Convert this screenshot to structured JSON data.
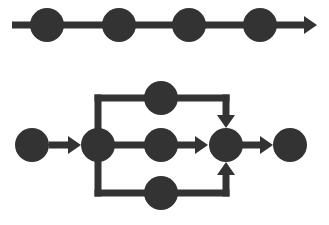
{
  "canvas": {
    "width": 329,
    "height": 225,
    "background_color": "#ffffff",
    "ink_color": "#333333"
  },
  "style": {
    "node_radius": 17,
    "edge_thickness": 7,
    "arrowhead_length": 13,
    "arrowhead_half_width": 9
  },
  "diagrams": [
    {
      "id": "sequential-pipeline",
      "name": "Sequential pipeline",
      "type": "linear-chain",
      "node_count": 4,
      "nodes": [
        {
          "id": "seq-node-1",
          "label": "",
          "cx": 47,
          "cy": 25,
          "r": 17
        },
        {
          "id": "seq-node-2",
          "label": "",
          "cx": 119,
          "cy": 25,
          "r": 17
        },
        {
          "id": "seq-node-3",
          "label": "",
          "cx": 189,
          "cy": 25,
          "r": 17
        },
        {
          "id": "seq-node-4",
          "label": "",
          "cx": 260,
          "cy": 25,
          "r": 17
        }
      ],
      "edges": [
        {
          "id": "seq-edge-main",
          "from": "start",
          "to": "seq-arrow-end",
          "x1": 12,
          "y1": 25,
          "x2": 304,
          "y2": 25,
          "arrow": "end"
        }
      ],
      "arrowheads": [
        {
          "id": "seq-arrowhead",
          "tip_x": 317,
          "tip_y": 25,
          "direction": "right"
        }
      ]
    },
    {
      "id": "fork-join-pipeline",
      "name": "Fork join pipeline",
      "type": "branching",
      "node_count": 7,
      "branch_count": 3,
      "nodes": [
        {
          "id": "fj-start",
          "role": "start",
          "label": "",
          "cx": 32,
          "cy": 145,
          "r": 17
        },
        {
          "id": "fj-split",
          "role": "split",
          "label": "",
          "cx": 98,
          "cy": 145,
          "r": 17
        },
        {
          "id": "fj-branch-top",
          "role": "task",
          "label": "",
          "cx": 161,
          "cy": 98,
          "r": 17
        },
        {
          "id": "fj-branch-mid",
          "role": "task",
          "label": "",
          "cx": 161,
          "cy": 145,
          "r": 17
        },
        {
          "id": "fj-branch-bot",
          "role": "task",
          "label": "",
          "cx": 161,
          "cy": 193,
          "r": 17
        },
        {
          "id": "fj-merge",
          "role": "merge",
          "label": "",
          "cx": 226,
          "cy": 145,
          "r": 17
        },
        {
          "id": "fj-end",
          "role": "end",
          "label": "",
          "cx": 290,
          "cy": 145,
          "r": 17
        }
      ],
      "edges": [
        {
          "id": "fj-edge-start-split",
          "from": "fj-start",
          "to": "fj-split",
          "kind": "straight-right",
          "x1": 49,
          "y1": 145,
          "x2": 68,
          "y2": 145,
          "arrow": "end",
          "tip_x": 81,
          "tip_y": 145
        },
        {
          "id": "fj-edge-split-up",
          "from": "fj-split",
          "to": "fj-branch-top",
          "kind": "rail-up",
          "x1": 98,
          "y1": 145,
          "x2": 98,
          "y2": 98,
          "arrow": "none"
        },
        {
          "id": "fj-edge-top-rail",
          "from": "fj-split",
          "to": "fj-merge",
          "kind": "rail-horizontal-top",
          "x1": 98,
          "y1": 98,
          "x2": 226,
          "y2": 98,
          "arrow": "none"
        },
        {
          "id": "fj-edge-top-down",
          "from": "fj-branch-top",
          "to": "fj-merge",
          "kind": "rail-down",
          "x1": 226,
          "y1": 98,
          "x2": 226,
          "y2": 115,
          "arrow": "end",
          "tip_x": 226,
          "tip_y": 128,
          "direction": "down"
        },
        {
          "id": "fj-edge-split-mid",
          "from": "fj-split",
          "to": "fj-branch-mid",
          "kind": "straight-right",
          "x1": 112,
          "y1": 145,
          "x2": 147,
          "y2": 145,
          "arrow": "none"
        },
        {
          "id": "fj-edge-mid-merge",
          "from": "fj-branch-mid",
          "to": "fj-merge",
          "kind": "straight-right",
          "x1": 175,
          "y1": 145,
          "x2": 195,
          "y2": 145,
          "arrow": "end",
          "tip_x": 208,
          "tip_y": 145
        },
        {
          "id": "fj-edge-split-down",
          "from": "fj-split",
          "to": "fj-branch-bot",
          "kind": "rail-down",
          "x1": 98,
          "y1": 145,
          "x2": 98,
          "y2": 193,
          "arrow": "none"
        },
        {
          "id": "fj-edge-bot-rail",
          "from": "fj-split",
          "to": "fj-merge",
          "kind": "rail-horizontal-bottom",
          "x1": 98,
          "y1": 193,
          "x2": 226,
          "y2": 193,
          "arrow": "none"
        },
        {
          "id": "fj-edge-bot-up",
          "from": "fj-branch-bot",
          "to": "fj-merge",
          "kind": "rail-up",
          "x1": 226,
          "y1": 193,
          "x2": 226,
          "y2": 175,
          "arrow": "end",
          "tip_x": 226,
          "tip_y": 162,
          "direction": "up"
        },
        {
          "id": "fj-edge-merge-end",
          "from": "fj-merge",
          "to": "fj-end",
          "kind": "straight-right",
          "x1": 242,
          "y1": 145,
          "x2": 260,
          "y2": 145,
          "arrow": "end",
          "tip_x": 273,
          "tip_y": 145
        }
      ]
    }
  ]
}
